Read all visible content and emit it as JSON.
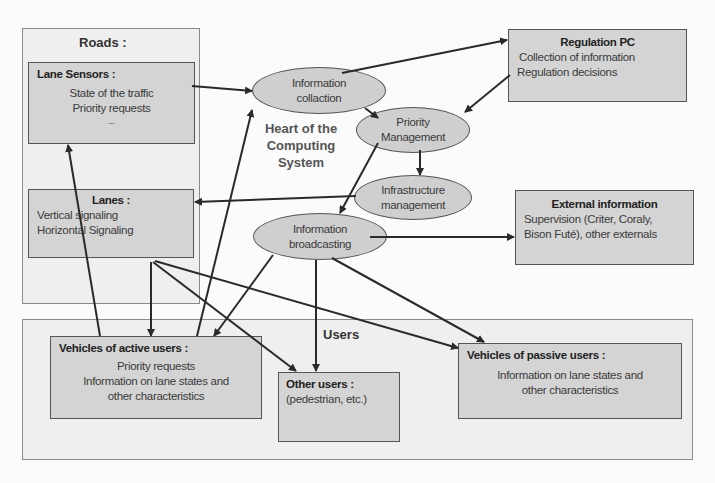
{
  "roads": {
    "title": "Roads :",
    "lane_sensors": {
      "title": "Lane Sensors   :",
      "lines": [
        "State of the traffic",
        "Priority requests",
        "..."
      ]
    },
    "lanes": {
      "title": "Lanes :",
      "lines": [
        "Vertical signaling",
        "Horizontal Signaling"
      ]
    }
  },
  "computing_system": {
    "label_lines": [
      "Heart of the",
      "Computing",
      "System"
    ],
    "nodes": {
      "information_collection": [
        "Information",
        "collaction"
      ],
      "priority_management": [
        "Priority",
        "Management"
      ],
      "infrastructure_management": [
        "Infrastructure",
        "management"
      ],
      "information_broadcasting": [
        "Information",
        "broadcasting"
      ]
    }
  },
  "regulation_pc": {
    "title": "Regulation PC",
    "lines": [
      "Collection of information",
      "Regulation decisions"
    ]
  },
  "external_information": {
    "title": "External information",
    "lines": [
      "Supervision (Criter, Coraly,",
      "Bison Futé), other externals"
    ]
  },
  "users": {
    "title": "Users",
    "active": {
      "title": "Vehicles of active users :",
      "lines": [
        "Priority requests",
        "Information on lane states and",
        "other characteristics"
      ]
    },
    "other": {
      "title": "Other users :",
      "lines": [
        "(pedestrian, etc.)"
      ]
    },
    "passive": {
      "title": "Vehicles of passive users :",
      "lines": [
        "Information on lane states and",
        "other characteristics"
      ]
    }
  },
  "colors": {
    "box_fill": "#d4d4d4",
    "group_fill": "#efefef",
    "arrow": "#2a2a2a"
  }
}
